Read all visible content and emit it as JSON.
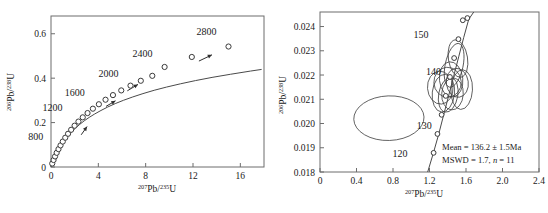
{
  "figure": {
    "name": "u-pb-concordia-figure",
    "panels": [
      "left",
      "right"
    ]
  },
  "chart_data": [
    {
      "id": "left",
      "type": "line",
      "title": "",
      "xlabel": "207Pb/235U",
      "ylabel": "206Pb/238U",
      "xlabel_parts": {
        "sup1": "207",
        "mid": "Pb/",
        "sup2": "235",
        "tail": "U"
      },
      "ylabel_parts": {
        "sup1": "206",
        "mid": "Pb/",
        "sup2": "238",
        "tail": "U"
      },
      "xlim": [
        0,
        18
      ],
      "ylim": [
        0,
        0.68
      ],
      "xticks": [
        0,
        4,
        8,
        12,
        16
      ],
      "xticklabels": [
        "0",
        "4",
        "8",
        "12",
        "16"
      ],
      "yticks": [
        0,
        0.2,
        0.4,
        0.6
      ],
      "yticklabels": [
        "0",
        "0.2",
        "0.4",
        "0.6"
      ],
      "grid": false,
      "legend": "none",
      "series": [
        {
          "name": "concordia-curve",
          "comment": "Wetherill concordia, age 0 to 3000 Ma",
          "x": [
            0.0,
            0.105,
            0.22,
            0.35,
            0.49,
            0.65,
            0.83,
            1.03,
            1.25,
            1.5,
            1.78,
            2.09,
            2.43,
            2.81,
            3.23,
            3.7,
            4.22,
            4.79,
            5.43,
            6.13,
            6.91,
            7.77,
            8.72,
            9.77,
            10.93,
            12.2,
            13.61,
            15.16,
            16.86,
            17.8
          ],
          "y": [
            0.0,
            0.0155,
            0.0315,
            0.0475,
            0.0635,
            0.0795,
            0.0955,
            0.1115,
            0.128,
            0.144,
            0.16,
            0.176,
            0.192,
            0.208,
            0.2235,
            0.239,
            0.2545,
            0.27,
            0.2855,
            0.3005,
            0.3155,
            0.3305,
            0.3455,
            0.36,
            0.3745,
            0.389,
            0.4035,
            0.4175,
            0.432,
            0.4395
          ]
        },
        {
          "name": "concordia-age-markers",
          "marker": "open-circle",
          "ages": [
            100,
            200,
            300,
            400,
            500,
            600,
            700,
            800,
            900,
            1000,
            1100,
            1200,
            1300,
            1400,
            1500,
            1600,
            1700,
            1800,
            1900,
            2000,
            2100,
            2200,
            2400,
            2600,
            2800
          ],
          "x": [
            0.104,
            0.217,
            0.342,
            0.48,
            0.633,
            0.804,
            0.994,
            1.205,
            1.44,
            1.702,
            1.994,
            2.32,
            2.683,
            3.088,
            3.54,
            4.045,
            4.608,
            5.236,
            5.937,
            6.718,
            7.589,
            8.56,
            9.6,
            11.9,
            15.0
          ],
          "y": [
            0.0156,
            0.0315,
            0.0476,
            0.0639,
            0.0805,
            0.0973,
            0.1145,
            0.1319,
            0.1496,
            0.1676,
            0.186,
            0.2046,
            0.2236,
            0.2429,
            0.2626,
            0.2826,
            0.303,
            0.3238,
            0.3449,
            0.3664,
            0.3883,
            0.4106,
            0.4505,
            0.4955,
            0.5425
          ]
        }
      ],
      "annotations": [
        {
          "label": "800",
          "x": 1.205,
          "y": 0.1319,
          "dx": -22,
          "dy": 2
        },
        {
          "label": "1200",
          "x": 2.32,
          "y": 0.2046,
          "dx": -16,
          "dy": -11
        },
        {
          "label": "1600",
          "x": 4.045,
          "y": 0.2826,
          "dx": -14,
          "dy": -8
        },
        {
          "label": "2000",
          "x": 6.718,
          "y": 0.3664,
          "dx": -12,
          "dy": -9
        },
        {
          "label": "2400",
          "x": 9.6,
          "y": 0.4505,
          "dx": -12,
          "dy": -10
        },
        {
          "label": "2800",
          "x": 15.0,
          "y": 0.5425,
          "dx": -12,
          "dy": -12
        }
      ],
      "arrows": [
        {
          "name": "arrow-800",
          "x1": 2.55,
          "y1": 0.145,
          "x2": 3.05,
          "y2": 0.182
        },
        {
          "name": "arrow-1600",
          "x1": 4.65,
          "y1": 0.273,
          "x2": 5.45,
          "y2": 0.298
        },
        {
          "name": "arrow-2000",
          "x1": 6.45,
          "y1": 0.343,
          "x2": 7.35,
          "y2": 0.372
        },
        {
          "name": "arrow-2400",
          "x1": 12.5,
          "y1": 0.477,
          "x2": 13.6,
          "y2": 0.505
        }
      ]
    },
    {
      "id": "right",
      "type": "scatter",
      "title": "",
      "xlabel": "207Pb/235U",
      "ylabel": "206Pb/238U",
      "xlabel_parts": {
        "sup1": "207",
        "mid": "Pb/",
        "sup2": "235",
        "tail": "U"
      },
      "ylabel_parts": {
        "sup1": "206",
        "mid": "Pb/",
        "sup2": "238",
        "tail": "U"
      },
      "xlim": [
        0,
        2.4
      ],
      "ylim": [
        0.018,
        0.0246
      ],
      "xticks": [
        0,
        0.4,
        0.8,
        1.2,
        1.6,
        2.0,
        2.4
      ],
      "xticklabels": [
        "0",
        "0.4",
        "0.8",
        "1.2",
        "1.6",
        "2.0",
        "2.4"
      ],
      "yticks": [
        0.018,
        0.019,
        0.02,
        0.021,
        0.022,
        0.023,
        0.024
      ],
      "yticklabels": [
        "0.018",
        "0.019",
        "0.020",
        "0.021",
        "0.022",
        "0.023",
        "0.024"
      ],
      "grid": false,
      "legend": "none",
      "series": [
        {
          "name": "concordia-curve",
          "x": [
            1.18,
            1.24,
            1.3,
            1.355,
            1.41,
            1.465,
            1.52,
            1.575,
            1.63,
            1.685
          ],
          "y": [
            0.018,
            0.01875,
            0.01955,
            0.02035,
            0.02115,
            0.02195,
            0.02275,
            0.02355,
            0.0243,
            0.0246
          ]
        },
        {
          "name": "concordia-age-markers",
          "marker": "open-circle",
          "ages": [
            120,
            125,
            130,
            135,
            140,
            145,
            150,
            155,
            160
          ],
          "x": [
            1.245,
            1.287,
            1.333,
            1.378,
            1.424,
            1.47,
            1.517,
            1.565,
            1.615
          ],
          "y": [
            0.01879,
            0.01957,
            0.02036,
            0.02114,
            0.02192,
            0.0227,
            0.02348,
            0.02426,
            0.02435
          ]
        }
      ],
      "annotations": [
        {
          "label": "120",
          "x": 1.245,
          "y": 0.01879,
          "dx": -26,
          "dy": 4
        },
        {
          "label": "130",
          "x": 1.333,
          "y": 0.02036,
          "dx": -10,
          "dy": 14
        },
        {
          "label": "140",
          "x": 1.424,
          "y": 0.02192,
          "dx": -9,
          "dy": -2
        },
        {
          "label": "150",
          "x": 1.517,
          "y": 0.02348,
          "dx": -30,
          "dy": -1
        }
      ],
      "ellipses": [
        {
          "cx": 0.755,
          "cy": 0.02022,
          "rx": 0.385,
          "ry": 0.00092,
          "rot": -2
        },
        {
          "cx": 1.318,
          "cy": 0.02148,
          "rx": 0.14,
          "ry": 0.00068,
          "rot": -4
        },
        {
          "cx": 1.352,
          "cy": 0.02125,
          "rx": 0.122,
          "ry": 0.00078,
          "rot": 6
        },
        {
          "cx": 1.398,
          "cy": 0.0217,
          "rx": 0.15,
          "ry": 0.00062,
          "rot": -3
        },
        {
          "cx": 1.405,
          "cy": 0.02118,
          "rx": 0.105,
          "ry": 0.00072,
          "rot": 10
        },
        {
          "cx": 1.437,
          "cy": 0.02182,
          "rx": 0.128,
          "ry": 0.00073,
          "rot": -6
        },
        {
          "cx": 1.452,
          "cy": 0.02122,
          "rx": 0.118,
          "ry": 0.00066,
          "rot": 4
        },
        {
          "cx": 1.47,
          "cy": 0.0224,
          "rx": 0.098,
          "ry": 0.00092,
          "rot": 12
        },
        {
          "cx": 1.505,
          "cy": 0.02168,
          "rx": 0.12,
          "ry": 0.0006,
          "rot": -8
        },
        {
          "cx": 1.553,
          "cy": 0.0214,
          "rx": 0.118,
          "ry": 0.00082,
          "rot": 3
        },
        {
          "cx": 1.512,
          "cy": 0.02268,
          "rx": 0.105,
          "ry": 0.00078,
          "rot": -9
        }
      ],
      "stats": {
        "mean_line": "Mean = 136.2 ± 1.5Ma",
        "mswd_line_pre": "MSWD = 1.7, ",
        "mswd_line_italic": "n",
        "mswd_line_post": " = 11"
      }
    }
  ]
}
